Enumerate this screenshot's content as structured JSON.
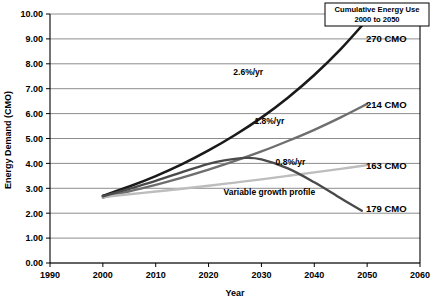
{
  "chart_data": {
    "type": "line",
    "title": "",
    "xlabel": "Year",
    "ylabel": "Energy Demand (CMO)",
    "xlim": [
      1990,
      2060
    ],
    "ylim": [
      0.0,
      10.0
    ],
    "xticks": [
      "1990",
      "2000",
      "2010",
      "2020",
      "2030",
      "2040",
      "2050",
      "2060"
    ],
    "yticks": [
      "0.00",
      "1.00",
      "2.00",
      "3.00",
      "4.00",
      "5.00",
      "6.00",
      "7.00",
      "8.00",
      "9.00",
      "10.00"
    ],
    "grid": "horizontal",
    "legend_position": "top-right-box",
    "series": [
      {
        "name": "2.6%/yr",
        "label": "2.6%/yr",
        "cumulative": "270 CMO",
        "color": "#1a1a1a",
        "width": 2.6,
        "x": [
          2000,
          2005,
          2010,
          2015,
          2020,
          2025,
          2030,
          2035,
          2040,
          2045,
          2050
        ],
        "values": [
          2.7,
          3.07,
          3.49,
          3.97,
          4.52,
          5.14,
          5.84,
          6.64,
          7.55,
          8.59,
          9.77
        ]
      },
      {
        "name": "1.8%/yr",
        "label": "1.8%/yr",
        "cumulative": "214 CMO",
        "color": "#6e6e6e",
        "width": 2.4,
        "x": [
          2000,
          2005,
          2010,
          2015,
          2020,
          2025,
          2030,
          2035,
          2040,
          2045,
          2050
        ],
        "values": [
          2.63,
          2.88,
          3.14,
          3.43,
          3.75,
          4.1,
          4.48,
          4.9,
          5.35,
          5.85,
          6.39
        ]
      },
      {
        "name": "0.8%/yr",
        "label": "0.8%/yr",
        "cumulative": "163 CMO",
        "color": "#bdbdbd",
        "width": 2.4,
        "x": [
          2000,
          2005,
          2010,
          2015,
          2020,
          2025,
          2030,
          2035,
          2040,
          2045,
          2050
        ],
        "values": [
          2.65,
          2.76,
          2.87,
          2.98,
          3.1,
          3.23,
          3.36,
          3.5,
          3.64,
          3.78,
          3.93
        ]
      },
      {
        "name": "Variable growth profile",
        "label": "Variable growth profile",
        "cumulative": "179 CMO",
        "color": "#4a4a4a",
        "width": 2.4,
        "x": [
          2000,
          2005,
          2010,
          2015,
          2020,
          2023,
          2027,
          2030,
          2035,
          2040,
          2045,
          2049
        ],
        "values": [
          2.68,
          2.98,
          3.3,
          3.65,
          3.98,
          4.12,
          4.22,
          4.16,
          3.8,
          3.24,
          2.6,
          2.1
        ]
      }
    ],
    "annotations": [
      {
        "text": "2.6%/yr",
        "x": 2027.5,
        "y": 7.55
      },
      {
        "text": "1.8%/yr",
        "x": 2031.5,
        "y": 5.6
      },
      {
        "text": "0.8%/yr",
        "x": 2035.5,
        "y": 3.95
      },
      {
        "text": "Variable growth profile",
        "x": 2031.5,
        "y": 2.75
      }
    ],
    "endpoint_labels": [
      {
        "text": "270 CMO",
        "y": 9.0
      },
      {
        "text": "214 CMO",
        "y": 6.35
      },
      {
        "text": "163 CMO",
        "y": 3.9
      },
      {
        "text": "179 CMO",
        "y": 2.2
      }
    ],
    "legend_box": {
      "line1": "Cumulative Energy Use",
      "line2": "2000 to 2050"
    },
    "colors": {
      "gridline": "#808080",
      "axis": "#000000",
      "background": "#ffffff"
    }
  }
}
